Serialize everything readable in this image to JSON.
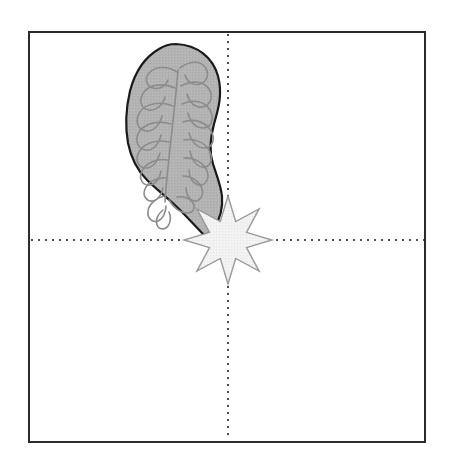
{
  "figure": {
    "canvas": {
      "width": 450,
      "height": 465,
      "background_color": "#ffffff"
    },
    "frame": {
      "name": "plot-border",
      "x": 29,
      "y": 32,
      "width": 396,
      "height": 410,
      "stroke_color": "#2b2b2b",
      "stroke_width": 2,
      "fill": "none"
    },
    "axes": {
      "horizontal": {
        "label": "horizontal-reference-axis",
        "y": 240,
        "x_start": 31,
        "x_end": 424,
        "style": "dotted",
        "color": "#4d4d4d",
        "dot_size": 2,
        "dot_gap": 5
      },
      "vertical": {
        "label": "vertical-reference-axis",
        "x": 228,
        "y_start": 34,
        "y_end": 440,
        "style": "dotted",
        "color": "#4d4d4d",
        "dot_size": 2,
        "dot_gap": 5
      },
      "origin": {
        "x": 228,
        "y": 240
      }
    },
    "organ_shape": {
      "name": "cerebellum-outline",
      "fill_color": "#b3b3b3",
      "stroke_color": "#1a1a1a",
      "stroke_width": 2.2,
      "internal_pattern_color": "#8c8c8c",
      "internal_pattern_width": 1.6,
      "internal_pattern_name": "arbor-vitae-branches",
      "bounding_box": {
        "x": 126,
        "y": 44,
        "width": 96,
        "height": 190
      },
      "quadrant": "upper-left"
    },
    "star_shape": {
      "name": "starburst-marker",
      "points": 8,
      "center_x": 228,
      "center_y": 240,
      "outer_radius": 44,
      "inner_radius": 20,
      "fill_color": "#f0f0f0",
      "stroke_color": "#9a9a9a",
      "stroke_width": 1.4,
      "rotation_deg": 0
    }
  },
  "chart_data": {
    "type": "scatter",
    "xlabel": "",
    "ylabel": "",
    "xlim": [
      0,
      396
    ],
    "ylim": [
      0,
      410
    ],
    "grid": false,
    "legend": "none",
    "annotations": [
      {
        "name": "cerebellum-outline",
        "shape": "blob",
        "quadrant": "upper-left",
        "fill": "#b3b3b3",
        "center": [
          174,
          139
        ]
      },
      {
        "name": "starburst-marker",
        "shape": "8-point-star",
        "quadrant": "center",
        "fill": "#f0f0f0",
        "center": [
          228,
          240
        ]
      }
    ],
    "series": [
      {
        "name": "crosshair-origin",
        "x": [
          228
        ],
        "y": [
          240
        ]
      }
    ]
  }
}
